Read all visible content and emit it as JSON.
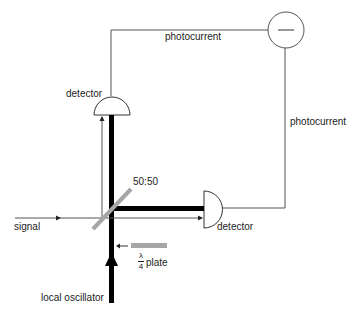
{
  "diagram": {
    "labels": {
      "photocurrent_top": "photocurrent",
      "photocurrent_right": "photocurrent",
      "detector_top": "detector",
      "detector_right": "detector",
      "beamsplitter": "50:50",
      "signal": "signal",
      "local_oscillator": "local oscillator",
      "waveplate_numerator": "λ",
      "waveplate_denominator": "4",
      "waveplate_suffix": "plate",
      "subtractor_symbol": "−"
    },
    "colors": {
      "beam": "#000000",
      "wire": "#555555",
      "optic_gray": "#a6a6a6",
      "text": "#222222"
    },
    "components": [
      {
        "id": "subtractor",
        "type": "circle",
        "symbol": "minus"
      },
      {
        "id": "detector_top",
        "type": "photodetector",
        "orientation": "up"
      },
      {
        "id": "detector_right",
        "type": "photodetector",
        "orientation": "right"
      },
      {
        "id": "beamsplitter",
        "type": "beamsplitter",
        "ratio": "50:50"
      },
      {
        "id": "waveplate",
        "type": "quarter-wave plate"
      }
    ],
    "edges": [
      {
        "from": "signal",
        "to": "beamsplitter"
      },
      {
        "from": "local_oscillator",
        "to": "beamsplitter",
        "via": "waveplate"
      },
      {
        "from": "beamsplitter",
        "to": "detector_top"
      },
      {
        "from": "beamsplitter",
        "to": "detector_right"
      },
      {
        "from": "detector_top",
        "to": "subtractor",
        "label": "photocurrent"
      },
      {
        "from": "detector_right",
        "to": "subtractor",
        "label": "photocurrent"
      }
    ]
  }
}
